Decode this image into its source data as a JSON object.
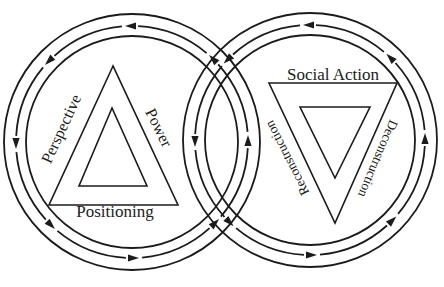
{
  "colors": {
    "line": "#1b1b1b",
    "background": "#ffffff"
  },
  "left_cycle": {
    "direction": "counterclockwise",
    "arrow_count": 8,
    "labels": {
      "left_side": "Perspective",
      "right_side": "Power",
      "bottom": "Positioning"
    }
  },
  "right_cycle": {
    "direction": "counterclockwise",
    "arrow_count": 8,
    "labels": {
      "top": "Social Action",
      "left_side": "Reconstruction",
      "right_side": "Deconstruction"
    }
  }
}
